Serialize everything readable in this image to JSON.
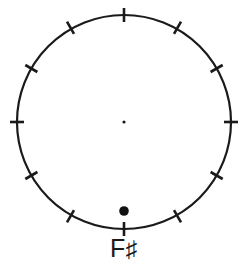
{
  "diagram": {
    "kind": "pitch-class-circle",
    "title": "",
    "background_color": "#ffffff",
    "stroke_color": "#1a1a1a",
    "circle": {
      "center_x": 124,
      "center_y": 122,
      "radius": 107,
      "stroke_width": 2.2
    },
    "center_dot": {
      "radius": 1.6,
      "color": "#1a1a1a"
    },
    "ticks": {
      "count": 12,
      "inner_offset": 7,
      "outer_offset": 7,
      "stroke_width": 2.6,
      "angles_deg": [
        0,
        30,
        60,
        90,
        120,
        150,
        180,
        210,
        240,
        270,
        300,
        330
      ],
      "clock_positions": [
        "12",
        "1",
        "2",
        "3",
        "4",
        "5",
        "6",
        "7",
        "8",
        "9",
        "10",
        "11"
      ]
    },
    "markers": [
      {
        "name": "selected-pitch-marker",
        "angle_deg": 180,
        "radius_from_center": 89,
        "dot_radius": 4.8,
        "color": "#111111"
      }
    ],
    "label": {
      "letter": "F",
      "accidental": "♯",
      "full_text": "F♯",
      "position": "below-circle-bottom",
      "color": "#1a1a1a"
    }
  }
}
